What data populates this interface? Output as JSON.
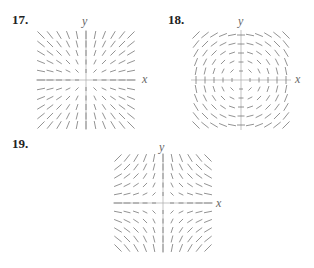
{
  "problems": [
    {
      "number": "17.",
      "ylabel": "y",
      "xlabel": "x",
      "field": "radial"
    },
    {
      "number": "18.",
      "ylabel": "y",
      "xlabel": "x",
      "field": "rotational"
    },
    {
      "number": "19.",
      "ylabel": "y",
      "xlabel": "x",
      "field": "saddle"
    }
  ],
  "colors": {
    "arrow": "#777777",
    "axis": "#aaaaaa",
    "text": "#222222"
  }
}
